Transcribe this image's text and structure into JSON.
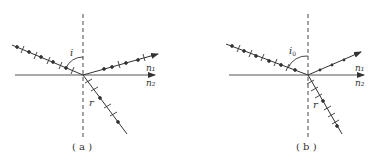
{
  "figure": {
    "colors": {
      "ink": "#333333",
      "background": "#ffffff"
    },
    "panels": [
      {
        "id": "a",
        "caption": "( a )",
        "incidence_angle_label": "i",
        "refraction_angle_label": "r",
        "medium_upper_label": "n₁",
        "medium_lower_label": "n₂",
        "incident_ray": "dots and ticks (natural light)",
        "reflected_ray": "dots and ticks (partially polarized)",
        "refracted_ray": "dots and ticks (partially polarized)"
      },
      {
        "id": "b",
        "caption": "( b )",
        "incidence_angle_label": "i",
        "incidence_angle_subscript": "0",
        "refraction_angle_label": "r",
        "medium_upper_label": "n₁",
        "medium_lower_label": "n₂",
        "incident_ray": "dots and ticks (natural light)",
        "reflected_ray": "dots only (linearly polarized)",
        "refracted_ray": "dots and ticks (partially polarized)"
      }
    ]
  }
}
